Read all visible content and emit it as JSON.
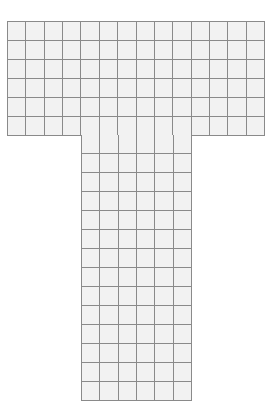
{
  "figure": {
    "shape": "T-shaped grid",
    "background_color": "#ffffff",
    "cell_fill_color": "#f2f2f2",
    "grid_line_color": "#8a8a8a",
    "top_bar": {
      "columns": 14,
      "rows": 6,
      "x": 7,
      "y": 21,
      "width": 258,
      "height": 115
    },
    "stem": {
      "columns": 6,
      "rows": 14,
      "column_offset": 4,
      "x": 81,
      "y": 135,
      "width": 111,
      "height": 266
    }
  }
}
